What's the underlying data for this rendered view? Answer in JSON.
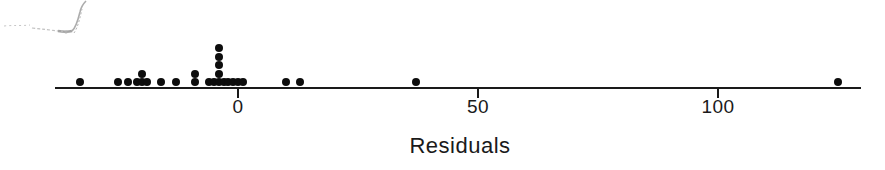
{
  "figure": {
    "title": "",
    "artifact_label": "scan-artifact-from-figure-above"
  },
  "axis": {
    "label": "Residuals",
    "tick_labels": [
      "0",
      "50",
      "100"
    ],
    "tick_values": [
      0,
      50,
      100
    ],
    "line_color": "#1a1a1a",
    "x_min_px": 55,
    "x_max_px": 861,
    "baseline_y_px": 87,
    "tick_label_y_px": 96,
    "axis_title_y_px": 133,
    "axis_title_x_px": 460
  },
  "chart_data": {
    "type": "scatter",
    "plot_style": "dotplot",
    "title": "",
    "xlabel": "Residuals",
    "ylabel": "",
    "xlim": [
      -38,
      130
    ],
    "grid": false,
    "legend": null,
    "tick_labels": [
      "0",
      "50",
      "100"
    ],
    "x": [
      -33,
      -25,
      -23,
      -21,
      -20,
      -20,
      -19,
      -16,
      -13,
      -9,
      -9,
      -6,
      -5,
      -4,
      -4,
      -4,
      -4,
      -4,
      -3,
      -2,
      -1,
      0,
      1,
      10,
      13,
      37,
      125
    ],
    "stacks": [
      {
        "value": -33,
        "count": 1
      },
      {
        "value": -25,
        "count": 1
      },
      {
        "value": -23,
        "count": 1
      },
      {
        "value": -21,
        "count": 1
      },
      {
        "value": -20,
        "count": 2
      },
      {
        "value": -19,
        "count": 1
      },
      {
        "value": -16,
        "count": 1
      },
      {
        "value": -13,
        "count": 1
      },
      {
        "value": -9,
        "count": 2
      },
      {
        "value": -6,
        "count": 1
      },
      {
        "value": -5,
        "count": 1
      },
      {
        "value": -4,
        "count": 5
      },
      {
        "value": -3,
        "count": 1
      },
      {
        "value": -2,
        "count": 1
      },
      {
        "value": -1,
        "count": 1
      },
      {
        "value": 0,
        "count": 1
      },
      {
        "value": 1,
        "count": 1
      },
      {
        "value": 10,
        "count": 1
      },
      {
        "value": 13,
        "count": 1
      },
      {
        "value": 37,
        "count": 1
      },
      {
        "value": 125,
        "count": 1
      }
    ],
    "n": 27,
    "dot_color": "#0d0d0d"
  }
}
